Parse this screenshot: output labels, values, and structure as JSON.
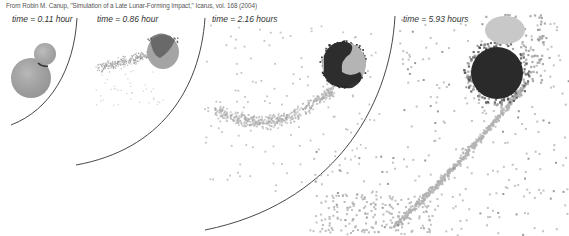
{
  "figure": {
    "citation": "From Robin M. Canup, \"Simulation of a Late Lunar-Forming Impact,\" Icarus, vol. 168 (2004)",
    "panels": [
      {
        "id": "panel-1",
        "time_label": "time = 0.11 hour"
      },
      {
        "id": "panel-2",
        "time_label": "time = 0.86 hour"
      },
      {
        "id": "panel-3",
        "time_label": "time = 2.16 hours"
      },
      {
        "id": "panel-4",
        "time_label": "time = 5.93 hours"
      }
    ],
    "colors": {
      "background": "#ffffff",
      "arc_line": "#333333",
      "particle_light": "#b8b8b8",
      "particle_mid": "#9a9a9a",
      "particle_dark": "#2e2e2e",
      "sphere_gray": "#a8a8a8"
    }
  }
}
